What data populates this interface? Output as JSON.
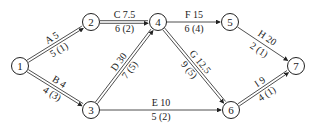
{
  "nodes": [
    {
      "id": "1",
      "x": 20,
      "y": 66
    },
    {
      "id": "2",
      "x": 91,
      "y": 22
    },
    {
      "id": "3",
      "x": 91,
      "y": 110
    },
    {
      "id": "4",
      "x": 158,
      "y": 22
    },
    {
      "id": "5",
      "x": 230,
      "y": 22
    },
    {
      "id": "6",
      "x": 231,
      "y": 110
    },
    {
      "id": "7",
      "x": 296,
      "y": 66
    }
  ],
  "edges": [
    {
      "from": "1",
      "to": "2",
      "top": "A 5",
      "bottom": "5 (1)",
      "double": true
    },
    {
      "from": "1",
      "to": "3",
      "top": "B 4",
      "bottom": "4 (3)",
      "double": true
    },
    {
      "from": "2",
      "to": "4",
      "top": "C 7.5",
      "bottom": "6 (2)",
      "double": true
    },
    {
      "from": "3",
      "to": "4",
      "top": "D 30",
      "bottom": "7 (5)",
      "double": true
    },
    {
      "from": "3",
      "to": "6",
      "top": "E 10",
      "bottom": "5 (2)",
      "double": false
    },
    {
      "from": "4",
      "to": "5",
      "top": "F 15",
      "bottom": "6 (4)",
      "double": false
    },
    {
      "from": "4",
      "to": "6",
      "top": "G 12.5",
      "bottom": "9 (5)",
      "double": true
    },
    {
      "from": "5",
      "to": "7",
      "top": "H 20",
      "bottom": "2 (1)",
      "double": false
    },
    {
      "from": "6",
      "to": "7",
      "top": "I 9",
      "bottom": "4 (1)",
      "double": true
    }
  ],
  "colors": {
    "line": "#222222",
    "background": "#ffffff"
  }
}
